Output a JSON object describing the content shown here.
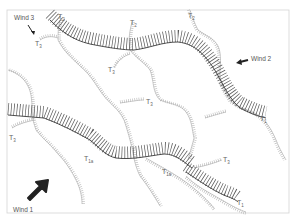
{
  "figure": {
    "frame": {
      "x": 7,
      "y": 10,
      "width": 282,
      "height": 203,
      "stroke": "#d0d0d0"
    },
    "colors": {
      "primary_crest": "#3a3a3a",
      "secondary_crest": "#9a9a9a",
      "arrow": "#222222",
      "label": "#555555"
    },
    "winds": [
      {
        "label": "Wind 1",
        "position": "bottom-left",
        "arrow": "large-solid-arrow-up-right"
      },
      {
        "label": "Wind 2",
        "position": "right",
        "arrow": "medium-arrow-left"
      },
      {
        "label": "Wind 3",
        "position": "top-left",
        "arrow": "thin-arrow-down-right"
      }
    ],
    "ridge_labels": [
      {
        "id": "t2-top-left",
        "main": "T",
        "sub": "2"
      },
      {
        "id": "t2-top-mid",
        "main": "T",
        "sub": "2"
      },
      {
        "id": "t2-top-right",
        "main": "T",
        "sub": "2"
      },
      {
        "id": "t3-top-left",
        "main": "T",
        "sub": "3"
      },
      {
        "id": "t3-mid-upper",
        "main": "T",
        "sub": "3"
      },
      {
        "id": "t3-mid-lower",
        "main": "T",
        "sub": "3"
      },
      {
        "id": "t3-left",
        "main": "T",
        "sub": "3"
      },
      {
        "id": "t3-bottom-right",
        "main": "T",
        "sub": "3"
      },
      {
        "id": "t1-right-upper",
        "main": "T",
        "sub": "1"
      },
      {
        "id": "t1-bottom-right",
        "main": "T",
        "sub": "1"
      },
      {
        "id": "t1a-left",
        "main": "T",
        "sub": "1a"
      },
      {
        "id": "t1a-right",
        "main": "T",
        "sub": "1a"
      }
    ]
  }
}
